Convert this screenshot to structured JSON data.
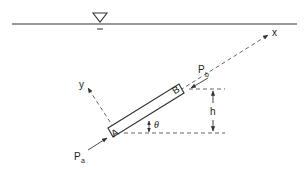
{
  "diagram": {
    "type": "inclined pipe segment below free water surface",
    "free_surface_symbol": "▽",
    "labels": {
      "x_axis": "x",
      "y_axis": "y",
      "point_a": "A",
      "point_b": "B",
      "pressure_a": "P",
      "pressure_a_sub": "a",
      "pressure_b": "P",
      "pressure_b_sub": "b",
      "height": "h",
      "angle": "θ"
    },
    "colors": {
      "line": "#333333",
      "background": "#ffffff"
    }
  }
}
